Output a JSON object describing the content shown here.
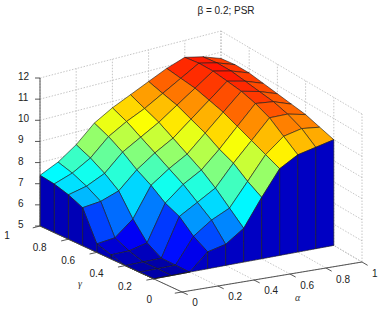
{
  "chart_data": {
    "type": "surface3d",
    "title": "β = 0.2; PSR",
    "xlabel": "α",
    "ylabel": "γ",
    "zlabel": "",
    "xlim": [
      0,
      1
    ],
    "ylim": [
      0,
      1
    ],
    "zlim": [
      5,
      12
    ],
    "xticks": [
      "0",
      "0.2",
      "0.4",
      "0.6",
      "0.8",
      "1"
    ],
    "yticks": [
      "0",
      "0.2",
      "0.4",
      "0.6",
      "0.8",
      "1"
    ],
    "zticks": [
      "5",
      "6",
      "7",
      "8",
      "9",
      "10",
      "11",
      "12"
    ],
    "grid": true,
    "colormap": "jet",
    "alpha": [
      0,
      0.1,
      0.2,
      0.3,
      0.4,
      0.5,
      0.6,
      0.7,
      0.8,
      0.9,
      1.0
    ],
    "gamma": [
      0.2,
      0.3,
      0.4,
      0.5,
      0.6,
      0.7,
      0.8,
      0.9,
      1.0
    ],
    "z_rows_by_gamma": [
      [
        5.0,
        5.0,
        5.0,
        5.8,
        6.0,
        6.6,
        7.9,
        9.1,
        9.6,
        9.8,
        10.0
      ],
      [
        5.0,
        5.0,
        5.0,
        6.2,
        6.8,
        7.2,
        8.3,
        9.4,
        10.1,
        10.3,
        10.2
      ],
      [
        5.0,
        5.0,
        5.0,
        6.8,
        7.3,
        7.8,
        8.8,
        9.7,
        10.6,
        10.6,
        10.4
      ],
      [
        5.2,
        5.2,
        5.4,
        7.1,
        7.8,
        8.3,
        9.1,
        10.0,
        10.9,
        10.8,
        10.5
      ],
      [
        5.4,
        5.5,
        6.2,
        7.6,
        8.2,
        8.7,
        9.5,
        10.3,
        11.1,
        10.9,
        10.6
      ],
      [
        6.8,
        6.9,
        7.2,
        8.0,
        8.6,
        9.1,
        9.8,
        10.5,
        11.2,
        11.0,
        10.7
      ],
      [
        7.1,
        7.3,
        7.7,
        8.5,
        9.0,
        9.5,
        10.1,
        10.7,
        11.3,
        11.1,
        10.8
      ],
      [
        7.3,
        7.6,
        8.1,
        8.9,
        9.4,
        9.8,
        10.3,
        10.8,
        11.3,
        11.1,
        10.8
      ],
      [
        7.4,
        7.8,
        8.4,
        9.2,
        9.7,
        10.1,
        10.5,
        10.9,
        11.2,
        11.0,
        10.7
      ]
    ]
  }
}
